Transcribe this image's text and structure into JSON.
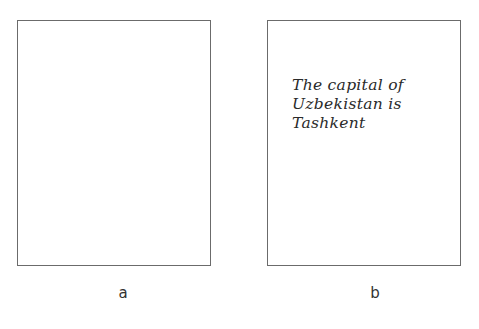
{
  "panels": [
    {
      "label": "a",
      "content": ""
    },
    {
      "label": "b",
      "content": "The capital of\nUzbekistan is\nTashkent"
    }
  ],
  "colors": {
    "border": "#6b6b6b",
    "text": "#2a2a2a",
    "background": "#ffffff"
  }
}
